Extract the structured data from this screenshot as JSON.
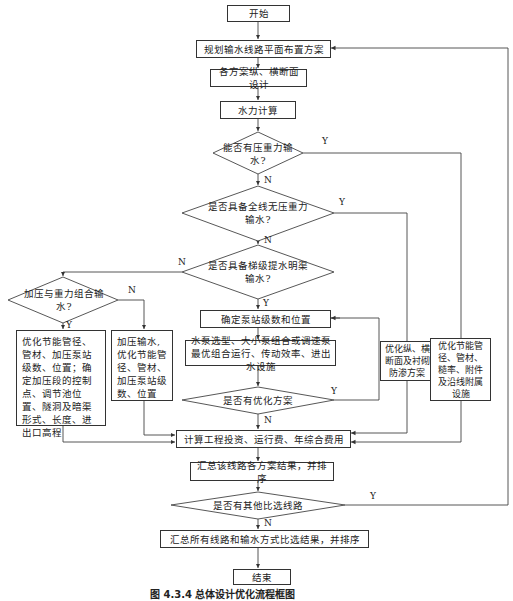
{
  "diagram": {
    "type": "flowchart",
    "caption": "图 4.3.4   总体设计优化流程框图",
    "nodes": {
      "start": "开始",
      "plan_layout": "规划输水线路平面布置方案",
      "section_design": "各方案纵、横断面设计",
      "hydraulic_calc": "水力计算",
      "d_pressure_gravity": "能否有压重力输水?",
      "d_full_gravity": "是否具备全线无压重力输水?",
      "d_cascade_canal": "是否具备梯级提水明渠输水?",
      "d_combined": "加压与重力组合输水?",
      "box_combined_opt": "优化节能管径、管材、加压泵站级数、位置；确定加压段的控制点、调节池位置、隧洞及暗渠形式、长度、进出口高程",
      "box_pressure_opt": "加压输水,优化节能管径、管材、加压泵站级数、位置",
      "pump_station": "确定泵站级数和位置",
      "pump_selection": "水泵选型、大小泵组合或调速泵最优组合运行、传动效率、进出水设施",
      "box_section_opt": "优化纵、横断面及衬砌防渗方案",
      "box_pipe_opt": "优化节能管径、管材、糙率、附件及沿线附属设施",
      "d_optimize": "是否有优化方案",
      "cost_calc": "计算工程投资、运行费、年综合费用",
      "summary_line": "汇总该线路各方案结果，并排序",
      "d_other_route": "是否有其他比选线路",
      "summary_all": "汇总所有线路和输水方式比选结果，并排序",
      "end": "结束"
    },
    "edge_labels": {
      "yes": "Y",
      "no": "N"
    }
  }
}
